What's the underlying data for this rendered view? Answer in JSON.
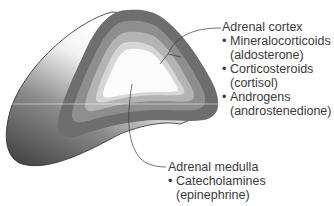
{
  "diagram": {
    "colors": {
      "outer_gland_dark": "#3c3c3c",
      "outer_gland_light": "#f2f2f2",
      "capsule": "#6e6e6e",
      "zona_glomerulosa": "#8e8e8e",
      "zona_fasciculata": "#b4b4b4",
      "zona_reticularis": "#d6d6d6",
      "medulla": "#fbfbfb",
      "leader_line": "#3a3a3a",
      "text": "#3a3a3a"
    },
    "cortex": {
      "title": "Adrenal cortex",
      "items": [
        {
          "bullet": "•",
          "name": "Mineralocorticoids",
          "example": "(aldosterone)"
        },
        {
          "bullet": "•",
          "name": "Corticosteroids",
          "example": "(cortisol)"
        },
        {
          "bullet": "•",
          "name": "Androgens",
          "example": "(androstenedione)"
        }
      ]
    },
    "medulla": {
      "title": "Adrenal medulla",
      "items": [
        {
          "bullet": "•",
          "name": "Catecholamines",
          "example": "(epinephrine)"
        }
      ]
    }
  }
}
